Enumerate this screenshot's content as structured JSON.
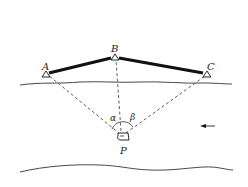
{
  "diagram": {
    "stations": [
      {
        "id": "A",
        "label": "A",
        "x": 46,
        "y": 74
      },
      {
        "id": "B",
        "label": "B",
        "x": 115,
        "y": 58
      },
      {
        "id": "C",
        "label": "C",
        "x": 206,
        "y": 74
      }
    ],
    "observer": {
      "id": "P",
      "label": "P",
      "x": 122,
      "y": 137
    },
    "angles": [
      {
        "id": "alpha",
        "label": "α",
        "between": [
          "A",
          "B"
        ]
      },
      {
        "id": "beta",
        "label": "β",
        "between": [
          "B",
          "C"
        ]
      }
    ],
    "baselines": [
      [
        "A",
        "B"
      ],
      [
        "B",
        "C"
      ]
    ],
    "sight_lines": [
      [
        "P",
        "A"
      ],
      [
        "P",
        "B"
      ],
      [
        "P",
        "C"
      ]
    ],
    "flow_direction": "left",
    "colors": {
      "line": "#111111",
      "dashed": "#333333",
      "bank": "#333333"
    }
  }
}
